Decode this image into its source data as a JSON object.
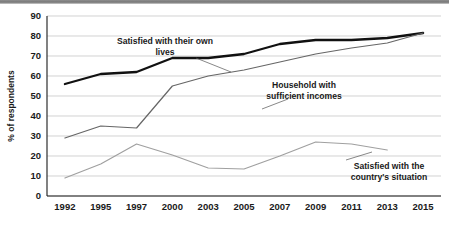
{
  "chart_data": {
    "type": "line",
    "title": "",
    "subtitle": "",
    "xlabel": "",
    "ylabel": "% of respondents",
    "categories": [
      "1992",
      "1995",
      "1997",
      "2000",
      "2003",
      "2005",
      "2007",
      "2009",
      "2011",
      "2013",
      "2015"
    ],
    "ylim": [
      0,
      90
    ],
    "yticks": [
      0,
      10,
      20,
      30,
      40,
      50,
      60,
      70,
      80,
      90
    ],
    "ytick_labels": [
      "0",
      "10",
      "20",
      "30",
      "40",
      "50",
      "60",
      "70",
      "80",
      "90"
    ],
    "grid": "horizontal",
    "legend": "inline-annotations",
    "series": [
      {
        "name": "Satisfied with their own lives",
        "color": "#111111",
        "width": 2.3,
        "values": [
          56,
          61,
          62,
          69,
          69,
          71,
          76,
          78,
          78,
          79,
          81.5
        ]
      },
      {
        "name": "Household with sufficient incomes",
        "color": "#666666",
        "width": 1.2,
        "values": [
          29,
          35,
          34,
          55,
          60,
          63,
          67,
          71,
          74,
          76.5,
          81.5
        ]
      },
      {
        "name": "Satisfied with the country's situation",
        "color": "#a0a0a0",
        "width": 1.2,
        "values": [
          9,
          16,
          26,
          20.5,
          14,
          13.5,
          20,
          27,
          26,
          23,
          null
        ]
      }
    ],
    "annotations": [
      {
        "id": "annot-own-lives",
        "lines": [
          "Satisfied with their own",
          "lives"
        ],
        "x": 165,
        "y": 44
      },
      {
        "id": "annot-household-income",
        "lines": [
          "Household with",
          "sufficient incomes"
        ],
        "x": 304,
        "y": 88
      },
      {
        "id": "annot-country-situation",
        "lines": [
          "Satisfied with the",
          "country's situation"
        ],
        "x": 389,
        "y": 169
      }
    ]
  },
  "axis": {
    "y_title": "% of respondents"
  }
}
